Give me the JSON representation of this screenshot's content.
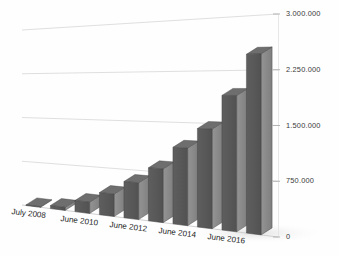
{
  "chart_data": {
    "type": "bar",
    "title": "",
    "subtitle": "",
    "xlabel": "",
    "ylabel": "",
    "grid": true,
    "legend": false,
    "legend_position": "none",
    "projection": "3d-perspective",
    "y_axis_side": "right",
    "ylim": [
      0,
      3000000
    ],
    "ytick_labels": [
      "0",
      "750.000",
      "1.500.000",
      "2.250.000",
      "3.000.000"
    ],
    "ytick_values": [
      0,
      750000,
      1500000,
      2250000,
      3000000
    ],
    "categories": [
      "July 2008",
      "",
      "June 2010",
      "",
      "June 2012",
      "",
      "June 2014",
      "",
      "June 2016",
      ""
    ],
    "xtick_labels": [
      "July 2008",
      "June 2010",
      "June 2012",
      "June 2014",
      "June 2016"
    ],
    "values": [
      10000,
      50000,
      180000,
      350000,
      560000,
      800000,
      1130000,
      1420000,
      1900000,
      2470000
    ],
    "series": [
      {
        "name": "Total",
        "values": [
          10000,
          50000,
          180000,
          350000,
          560000,
          800000,
          1130000,
          1420000,
          1900000,
          2470000
        ]
      }
    ]
  },
  "style": {
    "background": "#fefefe",
    "bar_front": "#5a5a5a",
    "bar_side": "#8d8d8d",
    "bar_top": "#6e6e6e",
    "bar_edge": "#3f3f3f",
    "gridline": "#d9d9d9",
    "axis_line": "#cfcfcf",
    "tick_color": "#b4b4b4",
    "label_color": "#3b3b3b",
    "xlabel_color": "#262626",
    "shadow": "#ededed"
  },
  "axis": {
    "ytick_0": "0",
    "ytick_1": "750.000",
    "ytick_2": "1.500.000",
    "ytick_3": "2.250.000",
    "ytick_4": "3.000.000",
    "xtick_0": "July 2008",
    "xtick_1": "June 2010",
    "xtick_2": "June 2012",
    "xtick_3": "June 2014",
    "xtick_4": "June 2016"
  }
}
